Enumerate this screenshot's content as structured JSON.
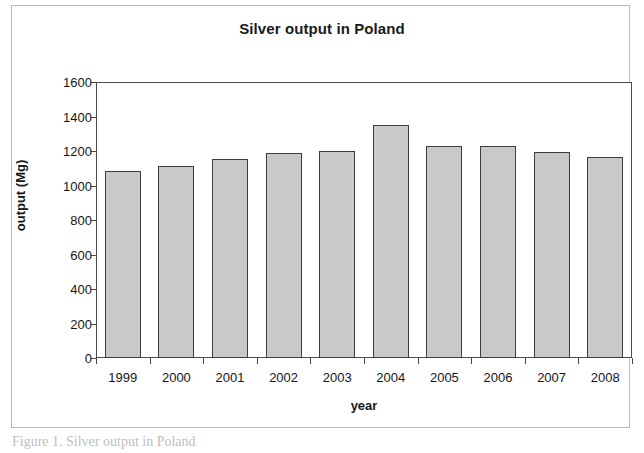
{
  "figure": {
    "caption": "Figure 1. Silver output in Poland"
  },
  "chart_data": {
    "type": "bar",
    "title": "Silver output in Poland",
    "xlabel": "year",
    "ylabel": "output (Mg)",
    "categories": [
      "1999",
      "2000",
      "2001",
      "2002",
      "2003",
      "2004",
      "2005",
      "2006",
      "2007",
      "2008"
    ],
    "values": [
      1084,
      1113,
      1154,
      1189,
      1200,
      1351,
      1229,
      1229,
      1194,
      1165
    ],
    "ylim": [
      0,
      1600
    ],
    "ytick_step": 200,
    "yticks": [
      "1600",
      "1400",
      "1200",
      "1000",
      "800",
      "600",
      "400",
      "200",
      "0"
    ],
    "grid": false,
    "legend": false,
    "bar_fill_color": "#c9c9c9",
    "bar_border_color": "#3d3d3d",
    "axis_color": "#4a4a4a",
    "background_color": "#ffffff"
  }
}
